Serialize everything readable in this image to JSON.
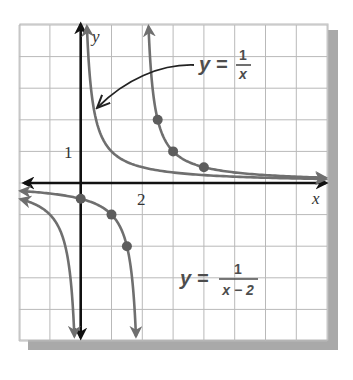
{
  "chart_data": {
    "type": "line",
    "title": "",
    "xlabel": "x",
    "ylabel": "y",
    "xlim": [
      -2,
      8
    ],
    "ylim": [
      -5,
      5
    ],
    "grid": true,
    "grid_step": 1,
    "tick_labels": {
      "x": [
        {
          "value": 2,
          "label": "2"
        }
      ],
      "y": [
        {
          "value": 1,
          "label": "1"
        }
      ]
    },
    "series": [
      {
        "name": "y = 1/x",
        "function": "1/x",
        "asymptotes": {
          "vertical": 0,
          "horizontal": 0
        },
        "color": "#6f6f6f",
        "points": []
      },
      {
        "name": "y = 1/(x - 2)",
        "function": "1/(x-2)",
        "asymptotes": {
          "vertical": 2,
          "horizontal": 0
        },
        "color": "#6f6f6f",
        "points": [
          {
            "x": 2.5,
            "y": 2
          },
          {
            "x": 3,
            "y": 1
          },
          {
            "x": 4,
            "y": 0.5
          },
          {
            "x": 0,
            "y": -0.5
          },
          {
            "x": 1,
            "y": -1
          },
          {
            "x": 1.5,
            "y": -2
          }
        ]
      }
    ],
    "annotations": [
      {
        "text": "y = 1/x",
        "lhs": "y =",
        "numerator": "1",
        "denominator": "x",
        "points_to": "y = 1/x curve",
        "has_arrow": true
      },
      {
        "text": "y = 1/(x − 2)",
        "lhs": "y =",
        "numerator": "1",
        "denominator": "x − 2",
        "has_arrow": false
      }
    ],
    "legend": "none (inline labels)"
  },
  "labels": {
    "x_axis": "x",
    "y_axis": "y",
    "tick_x_2": "2",
    "tick_y_1": "1",
    "eq1_lhs": "y =",
    "eq1_num": "1",
    "eq1_den": "x",
    "eq2_lhs": "y =",
    "eq2_num": "1",
    "eq2_den": "x − 2"
  },
  "colors": {
    "grid": "#b9b9b9",
    "axes": "#111111",
    "curves": "#6f6f6f",
    "points": "#5d5d5d",
    "shadow": "#a9a9a9"
  }
}
